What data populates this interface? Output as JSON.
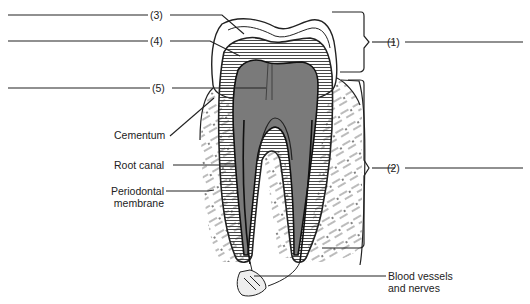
{
  "diagram": {
    "numbered_labels": [
      {
        "id": "label-1",
        "text": "(1)",
        "target": "crown bracket"
      },
      {
        "id": "label-2",
        "text": "(2)",
        "target": "root bracket"
      },
      {
        "id": "label-3",
        "text": "(3)",
        "target": "enamel"
      },
      {
        "id": "label-4",
        "text": "(4)",
        "target": "dentin"
      },
      {
        "id": "label-5",
        "text": "(5)",
        "target": "pulp cavity"
      }
    ],
    "named_labels": {
      "cementum": "Cementum",
      "root_canal": "Root canal",
      "periodontal_1": "Periodontal",
      "periodontal_2": "membrane",
      "blood_1": "Blood vessels",
      "blood_2": "and nerves"
    },
    "colors": {
      "line": "#222222",
      "pulp": "#7a7a7a",
      "dentin_stripe": "#333333",
      "background": "#ffffff"
    }
  }
}
